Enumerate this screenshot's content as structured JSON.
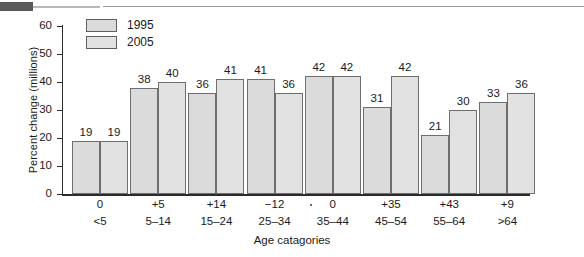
{
  "decoration": {
    "top_block_color": "#5a5a5a",
    "top_rule_color": "#9a9a9a"
  },
  "legend": {
    "position": "top-left-inside",
    "items": [
      {
        "label": "1995",
        "swatch_color": "#dbdbdb"
      },
      {
        "label": "2005",
        "swatch_color": "#e2e2e2"
      }
    ]
  },
  "axes": {
    "y_title": "Percent change (millions)",
    "x_title": "Age catagories",
    "y_ticks": [
      "0",
      "10",
      "20",
      "30",
      "40",
      "50",
      "60"
    ],
    "y_min": 0,
    "y_max": 60
  },
  "chart_data": {
    "type": "bar",
    "title": "",
    "xlabel": "Age catagories",
    "ylabel": "Percent change (millions)",
    "ylim": [
      0,
      60
    ],
    "ytick_step": 10,
    "grid": false,
    "legend_position": "upper left",
    "categories": [
      "<5",
      "5–14",
      "15–24",
      "25–34",
      "35–44",
      "45–54",
      "55–64",
      ">64"
    ],
    "percent_change_labels": [
      "0",
      "+5",
      "+14",
      "−12",
      "0",
      "+35",
      "+43",
      "+9"
    ],
    "series": [
      {
        "name": "1995",
        "values": [
          19,
          38,
          36,
          41,
          42,
          31,
          21,
          33
        ]
      },
      {
        "name": "2005",
        "values": [
          19,
          40,
          41,
          36,
          42,
          42,
          30,
          36
        ]
      }
    ]
  }
}
